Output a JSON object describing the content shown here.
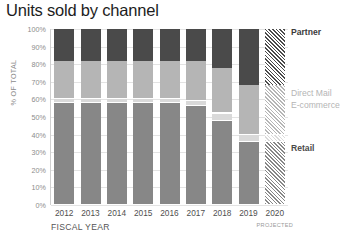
{
  "chart_data": {
    "type": "bar",
    "subtype": "stacked-100-percent",
    "title": "Units sold by channel",
    "xlabel": "FISCAL YEAR",
    "ylabel": "% OF TOTAL",
    "ylim": [
      0,
      100
    ],
    "yticks": [
      "0%",
      "10%",
      "20%",
      "30%",
      "40%",
      "50%",
      "60%",
      "70%",
      "80%",
      "90%",
      "100%"
    ],
    "ytick_values": [
      0,
      10,
      20,
      30,
      40,
      50,
      60,
      70,
      80,
      90,
      100
    ],
    "grid": true,
    "legend_position": "right",
    "categories": [
      "2012",
      "2013",
      "2014",
      "2015",
      "2016",
      "2017",
      "2018",
      "2019",
      "2020"
    ],
    "annotations": [
      {
        "text": "PROJECTED",
        "category": "2020"
      }
    ],
    "series": [
      {
        "name": "Retail",
        "color": "#878787",
        "values": [
          58,
          58,
          58,
          58,
          58,
          56,
          48,
          36,
          36
        ]
      },
      {
        "name": "E-commerce",
        "color": "#d9d9d9",
        "values": [
          2,
          2,
          2,
          2,
          2,
          3,
          4,
          4,
          4
        ]
      },
      {
        "name": "Direct Mail",
        "color": "#b5b5b5",
        "values": [
          22,
          22,
          22,
          22,
          22,
          23,
          26,
          28,
          28
        ]
      },
      {
        "name": "Partner",
        "color": "#4a4a4a",
        "values": [
          18,
          18,
          18,
          18,
          18,
          18,
          22,
          32,
          32
        ]
      }
    ],
    "projected_categories": [
      "2020"
    ]
  },
  "legend": {
    "partner": "Partner",
    "direct_mail": "Direct Mail",
    "ecommerce": "E-commerce",
    "retail": "Retail"
  }
}
